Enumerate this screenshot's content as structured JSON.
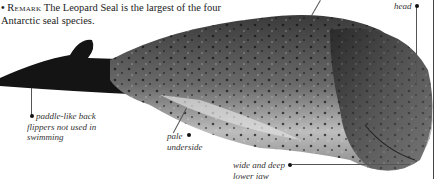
{
  "remark": {
    "bullet": "•",
    "keyword": "Remark",
    "text": " The Leopard Seal is the largest of the four Antarctic seal species."
  },
  "annotations": {
    "head": "head",
    "flippers": "paddle-like back flippers not used in swimming",
    "underside": "pale underside",
    "jaw": "wide and deep lower jaw"
  },
  "image": {
    "subject": "leopard-seal-photo"
  }
}
